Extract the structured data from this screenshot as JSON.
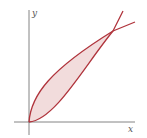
{
  "diagram": {
    "axis_labels": {
      "x": "x",
      "y": "y"
    },
    "curves": [
      {
        "name": "upper-curve",
        "shape": "square-root-like"
      },
      {
        "name": "lower-curve",
        "shape": "parabola-like"
      }
    ],
    "region": "shaded area between curves from origin to intersection",
    "colors": {
      "curve": "#b0343c",
      "fill": "#f2dcdc",
      "axis": "#666666"
    }
  }
}
